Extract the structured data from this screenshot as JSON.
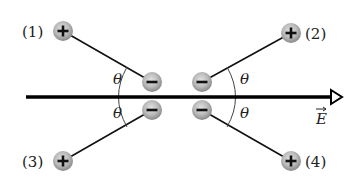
{
  "diagram": {
    "type": "physics-electric-dipoles",
    "field": {
      "label": "E",
      "vector_symbol": "→",
      "line": {
        "x1": 26,
        "y": 97,
        "x2": 331
      },
      "arrow_tip_x": 342,
      "label_pos": {
        "x": 316,
        "y": 124
      },
      "color": "#000000"
    },
    "angle_symbol": "θ",
    "angle_labels": [
      {
        "x": 113,
        "y": 84
      },
      {
        "x": 113,
        "y": 118
      },
      {
        "x": 240,
        "y": 84
      },
      {
        "x": 240,
        "y": 118
      }
    ],
    "ball_colors": {
      "center": "#d4d4d4",
      "edge": "#8a8a8a",
      "sign": "#111111"
    },
    "dipoles": [
      {
        "id": "1",
        "label": "(1)",
        "positive": {
          "x": 63,
          "y": 31
        },
        "negative": {
          "x": 152,
          "y": 82
        },
        "label_pos": {
          "x": 22,
          "y": 37
        }
      },
      {
        "id": "2",
        "label": "(2)",
        "positive": {
          "x": 291,
          "y": 33
        },
        "negative": {
          "x": 202,
          "y": 82
        },
        "label_pos": {
          "x": 305,
          "y": 39
        }
      },
      {
        "id": "3",
        "label": "(3)",
        "positive": {
          "x": 63,
          "y": 161
        },
        "negative": {
          "x": 152,
          "y": 110
        },
        "label_pos": {
          "x": 22,
          "y": 167
        }
      },
      {
        "id": "4",
        "label": "(4)",
        "positive": {
          "x": 291,
          "y": 161
        },
        "negative": {
          "x": 202,
          "y": 110
        },
        "label_pos": {
          "x": 305,
          "y": 167
        }
      }
    ],
    "plus_sign": "+",
    "minus_sign": "−"
  }
}
